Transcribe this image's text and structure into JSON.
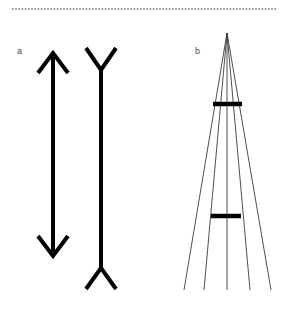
{
  "figure": {
    "width": 289,
    "height": 309,
    "background_color": "#ffffff",
    "stroke_color": "#000000",
    "thin_stroke_color": "#3a3a3a",
    "label_color": "#4a4a4a",
    "dotted_rule_color": "#808080"
  },
  "dotted_rule": {
    "name": "dotted-separator",
    "y": 9,
    "x_start": 12,
    "x_end": 277,
    "dot_size": 1.6,
    "dot_gap": 3.2
  },
  "panels": [
    {
      "id": "a",
      "label": "a",
      "label_x": 17,
      "label_y": 47,
      "illusion": "Muller-Lyer",
      "figures": [
        {
          "name": "double-headed-arrow-outward",
          "shaft_x": 53,
          "shaft_top_y": 57,
          "shaft_bottom_y": 252,
          "shaft_width": 4,
          "fin_length": 20,
          "fin_spread_x": 15,
          "top_tip_y": 53,
          "bottom_tip_y": 256,
          "fin_direction": "arrowhead-in"
        },
        {
          "name": "double-tailed-line-inward",
          "shaft_x": 101,
          "shaft_top_y": 70,
          "shaft_bottom_y": 268,
          "shaft_width": 4,
          "fin_length": 20,
          "fin_spread_x": 15,
          "top_fin_y": 48,
          "bottom_fin_y": 289,
          "fin_direction": "fin-out"
        }
      ]
    },
    {
      "id": "b",
      "label": "b",
      "label_x": 195,
      "label_y": 47,
      "illusion": "Ponzo",
      "apex": {
        "x": 227,
        "y": 33
      },
      "converging_lines": {
        "name": "converging-lines",
        "count": 5,
        "bottom_y": 290,
        "bottom_x_positions": [
          184,
          204,
          227,
          250,
          271
        ],
        "stroke_width": 0.9
      },
      "bars": [
        {
          "name": "upper-bar",
          "x_start": 213,
          "x_end": 242,
          "y": 104,
          "thickness": 4.5
        },
        {
          "name": "lower-bar",
          "x_start": 211,
          "x_end": 241,
          "y": 216,
          "thickness": 4.5
        }
      ]
    }
  ]
}
